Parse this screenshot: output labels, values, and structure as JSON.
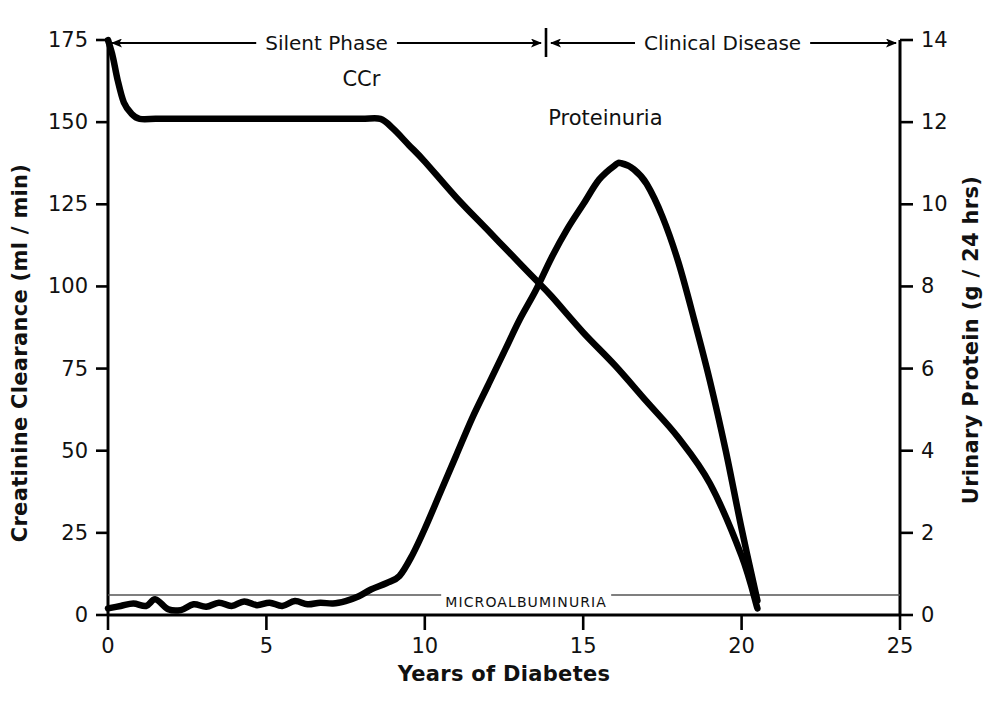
{
  "chart_data": {
    "type": "line",
    "title": "",
    "xlabel": "Years of Diabetes",
    "ylabel": "Creatinine Clearance (ml / min)",
    "ylabel_right": "Urinary Protein (g / 24 hrs)",
    "xlim": [
      0,
      25
    ],
    "ylim": [
      0,
      175
    ],
    "ylim_right": [
      0,
      14
    ],
    "grid": false,
    "legend_position": "inline-annotations",
    "x_ticks": [
      "0",
      "5",
      "10",
      "15",
      "20",
      "25"
    ],
    "x_tick_values": [
      0,
      5,
      10,
      15,
      20,
      25
    ],
    "y_ticks_left": [
      "0",
      "25",
      "50",
      "75",
      "100",
      "125",
      "150",
      "175"
    ],
    "y_tick_values_left": [
      0,
      25,
      50,
      75,
      100,
      125,
      150,
      175
    ],
    "y_ticks_right": [
      "0",
      "2",
      "4",
      "6",
      "8",
      "10",
      "12",
      "14"
    ],
    "y_tick_values_right": [
      0,
      2,
      4,
      6,
      8,
      10,
      12,
      14
    ],
    "series": [
      {
        "name": "CCr",
        "label": "CCr",
        "axis": "left",
        "units": "ml/min",
        "label_x": 8.0,
        "label_y": 163,
        "points": [
          [
            0.0,
            175
          ],
          [
            0.15,
            170
          ],
          [
            0.3,
            163
          ],
          [
            0.5,
            156
          ],
          [
            0.75,
            152.5
          ],
          [
            1.0,
            151
          ],
          [
            1.5,
            151
          ],
          [
            2.0,
            151
          ],
          [
            3.0,
            151
          ],
          [
            4.0,
            151
          ],
          [
            5.0,
            151
          ],
          [
            6.0,
            151
          ],
          [
            7.0,
            151
          ],
          [
            8.0,
            151
          ],
          [
            8.6,
            151
          ],
          [
            9.0,
            148
          ],
          [
            9.5,
            143
          ],
          [
            10.0,
            138
          ],
          [
            11.0,
            127
          ],
          [
            12.0,
            117
          ],
          [
            13.0,
            107
          ],
          [
            13.5,
            102
          ],
          [
            14.0,
            97
          ],
          [
            15.0,
            86
          ],
          [
            16.0,
            76
          ],
          [
            17.0,
            65
          ],
          [
            18.0,
            54
          ],
          [
            19.0,
            40
          ],
          [
            20.0,
            18
          ],
          [
            20.5,
            2
          ]
        ]
      },
      {
        "name": "Proteinuria",
        "label": "Proteinuria",
        "axis": "right",
        "units": "g/24 hrs",
        "label_x": 15.7,
        "label_y": 12.1,
        "points": [
          [
            0.0,
            0.16
          ],
          [
            0.4,
            0.22
          ],
          [
            0.8,
            0.28
          ],
          [
            1.2,
            0.22
          ],
          [
            1.5,
            0.38
          ],
          [
            1.9,
            0.14
          ],
          [
            2.3,
            0.12
          ],
          [
            2.7,
            0.26
          ],
          [
            3.1,
            0.2
          ],
          [
            3.5,
            0.3
          ],
          [
            3.9,
            0.22
          ],
          [
            4.3,
            0.33
          ],
          [
            4.7,
            0.24
          ],
          [
            5.1,
            0.3
          ],
          [
            5.5,
            0.22
          ],
          [
            5.9,
            0.34
          ],
          [
            6.3,
            0.26
          ],
          [
            6.7,
            0.3
          ],
          [
            7.1,
            0.28
          ],
          [
            7.5,
            0.34
          ],
          [
            7.9,
            0.45
          ],
          [
            8.3,
            0.62
          ],
          [
            8.8,
            0.78
          ],
          [
            9.2,
            0.95
          ],
          [
            9.6,
            1.45
          ],
          [
            10.0,
            2.1
          ],
          [
            10.5,
            3.0
          ],
          [
            11.0,
            3.9
          ],
          [
            11.5,
            4.8
          ],
          [
            12.0,
            5.6
          ],
          [
            12.5,
            6.4
          ],
          [
            13.0,
            7.2
          ],
          [
            13.5,
            7.9
          ],
          [
            14.0,
            8.7
          ],
          [
            14.5,
            9.4
          ],
          [
            15.0,
            10.0
          ],
          [
            15.5,
            10.6
          ],
          [
            16.0,
            10.95
          ],
          [
            16.2,
            11.0
          ],
          [
            16.6,
            10.85
          ],
          [
            17.0,
            10.5
          ],
          [
            17.5,
            9.7
          ],
          [
            18.0,
            8.6
          ],
          [
            18.5,
            7.2
          ],
          [
            19.0,
            5.7
          ],
          [
            19.5,
            4.0
          ],
          [
            20.0,
            2.1
          ],
          [
            20.5,
            0.35
          ]
        ]
      }
    ],
    "annotations": [
      {
        "name": "silent-phase",
        "text": "Silent Phase",
        "x_start": 0,
        "x_end": 13.8,
        "y": 175
      },
      {
        "name": "clinical-disease",
        "text": "Clinical Disease",
        "x_start": 13.8,
        "x_end": 25,
        "y": 175
      },
      {
        "name": "microalbuminuria",
        "text": "MICROALBUMINURIA",
        "x": 13.2,
        "y": 0.5
      }
    ],
    "reference_line": {
      "name": "microalbuminuria-threshold",
      "label": "MICROALBUMINURIA",
      "y_right": 0.5,
      "x_start": 0,
      "x_end": 25
    }
  },
  "colors": {
    "background": "#ffffff",
    "ink": "#000000",
    "curve": "#000000",
    "reference_line": "#555555"
  }
}
